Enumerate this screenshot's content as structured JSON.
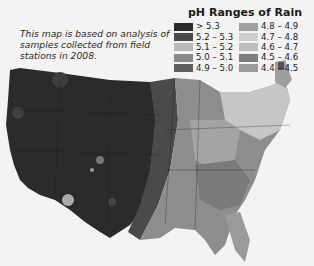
{
  "caption": "This map is based on analysis of samples collected from field stations in 2008.",
  "legend": {
    "title": "pH Ranges of Rain",
    "left": [
      {
        "label": "> 5.3",
        "color": "#2a2a2a"
      },
      {
        "label": "5.2 – 5.3",
        "color": "#4a4a4a"
      },
      {
        "label": "5.1 – 5.2",
        "color": "#b9b9b9"
      },
      {
        "label": "5.0 – 5.1",
        "color": "#8a8a8a"
      },
      {
        "label": "4.9 – 5.0",
        "color": "#5e5e5e"
      }
    ],
    "right": [
      {
        "label": "4.8 – 4.9",
        "color": "#a0a0a0"
      },
      {
        "label": "4.7 – 4.8",
        "color": "#cfcfcf"
      },
      {
        "label": "4.6 – 4.7",
        "color": "#bdbdbd"
      },
      {
        "label": "4.5 – 4.6",
        "color": "#7e7e7e"
      },
      {
        "label": "4.4 – 4.5",
        "color": "#9a9a9a"
      }
    ]
  }
}
